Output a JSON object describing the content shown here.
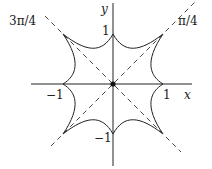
{
  "figure": {
    "axes": {
      "x_label": "x",
      "y_label": "y"
    },
    "ticks": {
      "x_pos": "1",
      "x_neg": "−1",
      "y_pos": "1",
      "y_neg": "−1"
    },
    "diagonal_labels": {
      "ne": "π/4",
      "nw": "3π/4"
    },
    "cusps": [
      {
        "x": 1,
        "y": 0
      },
      {
        "x": 1,
        "y": 1
      },
      {
        "x": 0,
        "y": 1
      },
      {
        "x": -1,
        "y": 1
      },
      {
        "x": -1,
        "y": 0
      },
      {
        "x": -1,
        "y": -1
      },
      {
        "x": 0,
        "y": -1
      },
      {
        "x": 1,
        "y": -1
      }
    ],
    "origin_marker": "filled dot",
    "colors": {
      "stroke": "#222222",
      "background": "#ffffff"
    }
  }
}
